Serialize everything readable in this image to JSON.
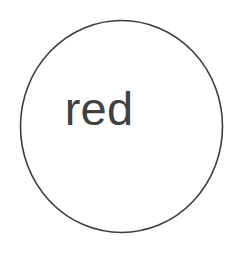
{
  "canvas": {
    "width": 241,
    "height": 253,
    "background_color": "#ffffff"
  },
  "diagram": {
    "type": "node-diagram",
    "node": {
      "shape": "circle-outline",
      "label": "red",
      "label_color": "#414141",
      "stroke_color": "#3c3c3c",
      "stroke_width": 1.6,
      "fill_color": "#ffffff",
      "center_x": 121.5,
      "center_y": 126.5,
      "radius_x": 101,
      "radius_y": 106
    }
  }
}
